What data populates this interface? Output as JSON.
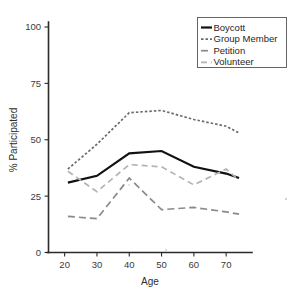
{
  "chart_data": {
    "type": "line",
    "title": "",
    "xlabel": "Age",
    "ylabel": "% Participated",
    "xlim": [
      15,
      78
    ],
    "ylim": [
      0,
      105
    ],
    "xticks": [
      20,
      30,
      40,
      50,
      60,
      70
    ],
    "xtick_labels": [
      "20",
      "30",
      "40",
      "50",
      "60",
      "70"
    ],
    "yticks": [
      0,
      25,
      50,
      75,
      100
    ],
    "ytick_labels": [
      "0",
      "25",
      "50",
      "75",
      "100"
    ],
    "grid": false,
    "legend_position": "top-right",
    "x": [
      21,
      30,
      40,
      50,
      60,
      70,
      74
    ],
    "series": [
      {
        "name": "Boycott",
        "values": [
          31,
          34,
          44,
          45,
          38,
          35,
          33
        ],
        "color": "#111111",
        "style": "solid",
        "width": 2.2,
        "dash": ""
      },
      {
        "name": "Group Member",
        "values": [
          37,
          48,
          62,
          63,
          59,
          56,
          53
        ],
        "color": "#6b6b6b",
        "style": "dotted",
        "width": 1.7,
        "dash": "2.5,2"
      },
      {
        "name": "Petition",
        "values": [
          16,
          15,
          33,
          19,
          20,
          18,
          17
        ],
        "color": "#8a8a8a",
        "style": "dashed",
        "width": 1.7,
        "dash": "7,4"
      },
      {
        "name": "Volunteer",
        "values": [
          36,
          27,
          39,
          38,
          30,
          37,
          32
        ],
        "color": "#b4b4b4",
        "style": "dashed",
        "width": 1.7,
        "dash": "6,4"
      }
    ]
  },
  "legend": {
    "entries": [
      {
        "label": "Boycott"
      },
      {
        "label": "Group Member"
      },
      {
        "label": "Petition"
      },
      {
        "label": "Volunteer"
      }
    ]
  },
  "axis_titles": {
    "x": "Age",
    "y": "% Participated"
  }
}
